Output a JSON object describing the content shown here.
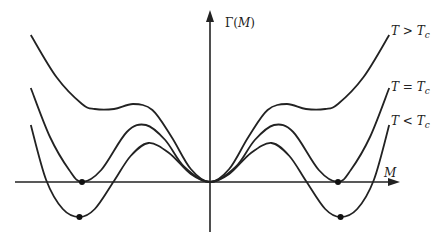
{
  "chart_data": {
    "type": "line",
    "title": "",
    "xlabel": "M",
    "ylabel": "Γ(M)",
    "xlim": [
      -1.55,
      1.45
    ],
    "ylim": [
      -0.5,
      1.75
    ],
    "grid": false,
    "series": [
      {
        "name": "T > T_c",
        "label": {
          "main": "T > T",
          "sub": "c"
        },
        "points": [
          [
            -1.4,
            1.47
          ],
          [
            -1.2,
            1.05
          ],
          [
            -1.0,
            0.78
          ],
          [
            -0.9,
            0.73
          ],
          [
            -0.75,
            0.73
          ],
          [
            -0.6,
            0.78
          ],
          [
            -0.45,
            0.72
          ],
          [
            -0.3,
            0.45
          ],
          [
            -0.15,
            0.13
          ],
          [
            0,
            0
          ],
          [
            0.15,
            0.13
          ],
          [
            0.3,
            0.45
          ],
          [
            0.45,
            0.72
          ],
          [
            0.6,
            0.78
          ],
          [
            0.75,
            0.73
          ],
          [
            0.9,
            0.73
          ],
          [
            1.0,
            0.78
          ],
          [
            1.2,
            1.05
          ],
          [
            1.4,
            1.47
          ]
        ]
      },
      {
        "name": "T = T_c",
        "label": {
          "main": "T = T",
          "sub": "c"
        },
        "points": [
          [
            -1.4,
            0.94
          ],
          [
            -1.25,
            0.45
          ],
          [
            -1.1,
            0.12
          ],
          [
            -1.0,
            0.0
          ],
          [
            -0.85,
            0.12
          ],
          [
            -0.65,
            0.5
          ],
          [
            -0.5,
            0.57
          ],
          [
            -0.35,
            0.42
          ],
          [
            -0.2,
            0.15
          ],
          [
            0,
            0
          ],
          [
            0.2,
            0.15
          ],
          [
            0.35,
            0.42
          ],
          [
            0.5,
            0.57
          ],
          [
            0.65,
            0.5
          ],
          [
            0.85,
            0.12
          ],
          [
            1.0,
            0.0
          ],
          [
            1.1,
            0.12
          ],
          [
            1.25,
            0.45
          ],
          [
            1.4,
            0.94
          ]
        ]
      },
      {
        "name": "T < T_c",
        "label": {
          "main": "T < T",
          "sub": "c"
        },
        "points": [
          [
            -1.4,
            0.57
          ],
          [
            -1.28,
            0.02
          ],
          [
            -1.15,
            -0.27
          ],
          [
            -1.02,
            -0.35
          ],
          [
            -0.9,
            -0.27
          ],
          [
            -0.75,
            0.01
          ],
          [
            -0.62,
            0.26
          ],
          [
            -0.48,
            0.39
          ],
          [
            -0.32,
            0.29
          ],
          [
            -0.15,
            0.08
          ],
          [
            0,
            0
          ],
          [
            0.15,
            0.08
          ],
          [
            0.32,
            0.29
          ],
          [
            0.48,
            0.39
          ],
          [
            0.62,
            0.26
          ],
          [
            0.75,
            0.01
          ],
          [
            0.9,
            -0.27
          ],
          [
            1.02,
            -0.35
          ],
          [
            1.15,
            -0.27
          ],
          [
            1.28,
            0.02
          ],
          [
            1.4,
            0.57
          ]
        ]
      }
    ],
    "markers": [
      {
        "name": "tc-min-left",
        "x": -1.0,
        "y": 0.0
      },
      {
        "name": "tc-min-right",
        "x": 1.0,
        "y": 0.0
      },
      {
        "name": "below-tc-min-left",
        "x": -1.02,
        "y": -0.35
      },
      {
        "name": "below-tc-min-right",
        "x": 1.02,
        "y": -0.35
      }
    ]
  },
  "labels": {
    "y_axis_main": "Γ(",
    "y_axis_var": "M",
    "y_axis_close": ")",
    "x_axis": "M"
  }
}
